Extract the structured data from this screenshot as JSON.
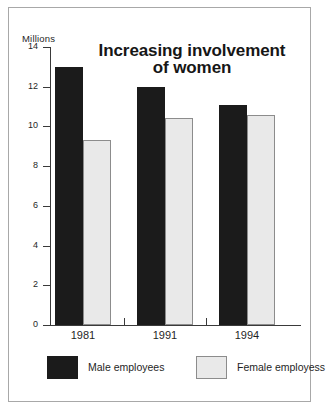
{
  "chart_data": {
    "type": "bar",
    "title": "Increasing involvement of women",
    "title_line1": "Increasing involvement",
    "title_line2": "of women",
    "xlabel": "",
    "ylabel": "Millions",
    "unit_label": "Millions",
    "categories": [
      "1981",
      "1991",
      "1994"
    ],
    "series": [
      {
        "name": "Male employees",
        "color": "#1b1b1b",
        "values": [
          13.0,
          12.0,
          11.1
        ]
      },
      {
        "name": "Female employess",
        "color": "#e9e9e9",
        "values": [
          9.3,
          10.4,
          10.6
        ]
      }
    ],
    "ylim": [
      0,
      14
    ],
    "ytick_values": [
      0,
      2,
      4,
      6,
      8,
      10,
      12,
      14
    ],
    "ytick_labels": [
      "0",
      "2",
      "4",
      "6",
      "8",
      "10",
      "12",
      "14"
    ],
    "grid": false,
    "legend_position": "bottom"
  },
  "legend": {
    "items": [
      {
        "label": "Male employees",
        "swatch": "male-swatch"
      },
      {
        "label": "Female employess",
        "swatch": "female-swatch"
      }
    ]
  },
  "colors": {
    "male": "#1b1b1b",
    "female": "#e9e9e9",
    "female_border": "#8c8c8c",
    "axis": "#3a3a3a",
    "frame": "#a8a8a8",
    "background": "#ffffff",
    "text": "#1f1f1f"
  }
}
